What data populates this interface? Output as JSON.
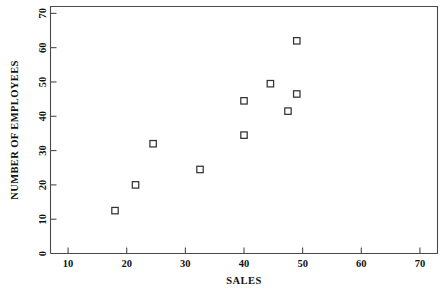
{
  "chart_data": {
    "type": "scatter",
    "title": "",
    "xlabel": "SALES",
    "ylabel": "NUMBER OF EMPLOYEES",
    "xlim": [
      7,
      73
    ],
    "ylim": [
      0,
      72
    ],
    "grid": false,
    "legend": null,
    "marker": "open-square",
    "xticks": [
      10,
      20,
      30,
      40,
      50,
      60,
      70
    ],
    "yticks": [
      0,
      10,
      20,
      30,
      40,
      50,
      60,
      70
    ],
    "xtick_labels": [
      "10",
      "20",
      "30",
      "40",
      "50",
      "60",
      "70"
    ],
    "ytick_labels": [
      "0",
      "10",
      "20",
      "30",
      "40",
      "50",
      "60",
      "70"
    ],
    "points": [
      {
        "x": 18.0,
        "y": 12.5
      },
      {
        "x": 21.5,
        "y": 20.0
      },
      {
        "x": 24.5,
        "y": 32.0
      },
      {
        "x": 32.5,
        "y": 24.5
      },
      {
        "x": 40.0,
        "y": 34.5
      },
      {
        "x": 40.0,
        "y": 44.5
      },
      {
        "x": 44.5,
        "y": 49.5
      },
      {
        "x": 47.5,
        "y": 41.5
      },
      {
        "x": 49.0,
        "y": 46.5
      },
      {
        "x": 49.0,
        "y": 62.0
      }
    ],
    "colors": {
      "axis": "#4a4a4a",
      "marker_edge": "#333333",
      "marker_face": "#ffffff",
      "text": "#111111",
      "background": "#ffffff"
    }
  }
}
